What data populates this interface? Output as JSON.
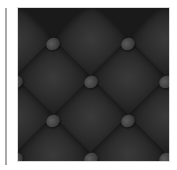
{
  "image": {
    "subject": "dark tufted leather texture",
    "colors": {
      "seam": "#111111",
      "cushion": "#2f2f2f",
      "button": "#454545",
      "divider": "#a9a9a9",
      "background": "#ffffff"
    },
    "cushions": [
      {
        "x": 15,
        "y": 5
      },
      {
        "x": 90,
        "y": 5
      },
      {
        "x": 165,
        "y": 5
      },
      {
        "x": 52,
        "y": 43
      },
      {
        "x": 127,
        "y": 43
      },
      {
        "x": 15,
        "y": 82
      },
      {
        "x": 90,
        "y": 82
      },
      {
        "x": 165,
        "y": 82
      },
      {
        "x": 52,
        "y": 120
      },
      {
        "x": 127,
        "y": 120
      },
      {
        "x": 15,
        "y": 158
      },
      {
        "x": 90,
        "y": 158
      },
      {
        "x": 165,
        "y": 158
      }
    ],
    "buttons": [
      {
        "x": 52,
        "y": 5
      },
      {
        "x": 127,
        "y": 5
      },
      {
        "x": 15,
        "y": 43
      },
      {
        "x": 90,
        "y": 43
      },
      {
        "x": 165,
        "y": 43
      },
      {
        "x": 52,
        "y": 82
      },
      {
        "x": 127,
        "y": 82
      },
      {
        "x": 15,
        "y": 120
      },
      {
        "x": 90,
        "y": 120
      },
      {
        "x": 165,
        "y": 120
      },
      {
        "x": 52,
        "y": 158
      },
      {
        "x": 127,
        "y": 158
      }
    ]
  }
}
